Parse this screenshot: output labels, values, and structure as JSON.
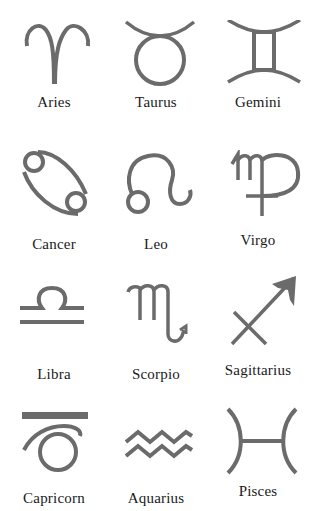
{
  "figure": {
    "symbol_color": "#6b6b6b",
    "label_color": "#1a1a1a",
    "signs": [
      {
        "name": "Aries",
        "icon": "aries-icon",
        "glyph": "♈"
      },
      {
        "name": "Taurus",
        "icon": "taurus-icon",
        "glyph": "♉"
      },
      {
        "name": "Gemini",
        "icon": "gemini-icon",
        "glyph": "♊"
      },
      {
        "name": "Cancer",
        "icon": "cancer-icon",
        "glyph": "♋"
      },
      {
        "name": "Leo",
        "icon": "leo-icon",
        "glyph": "♌"
      },
      {
        "name": "Virgo",
        "icon": "virgo-icon",
        "glyph": "♍"
      },
      {
        "name": "Libra",
        "icon": "libra-icon",
        "glyph": "♎"
      },
      {
        "name": "Scorpio",
        "icon": "scorpio-icon",
        "glyph": "♏"
      },
      {
        "name": "Sagittarius",
        "icon": "sagittarius-icon",
        "glyph": "♐"
      },
      {
        "name": "Capricorn",
        "icon": "capricorn-icon",
        "glyph": "♑"
      },
      {
        "name": "Aquarius",
        "icon": "aquarius-icon",
        "glyph": "♒"
      },
      {
        "name": "Pisces",
        "icon": "pisces-icon",
        "glyph": "♓"
      }
    ]
  }
}
